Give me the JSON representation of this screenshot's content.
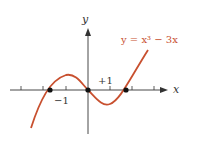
{
  "diagram": {
    "equation": "y = x³ − 3x",
    "axis_x_label": "x",
    "axis_y_label": "y",
    "tick_label_pos": "+1",
    "tick_label_neg": "−1",
    "curve_color": "#c8502f",
    "axis_color": "#333333",
    "roots": [
      -1.732,
      0,
      1.732
    ],
    "extrema": [
      {
        "x": -1,
        "y": 2
      },
      {
        "x": 1,
        "y": -2
      }
    ]
  }
}
